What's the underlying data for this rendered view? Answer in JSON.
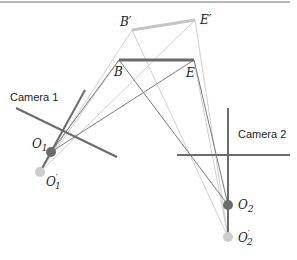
{
  "diagram": {
    "cameras": [
      {
        "label": "Camera 1",
        "center": "O_1",
        "center_shifted": "O_1'"
      },
      {
        "label": "Camera 2",
        "center": "O_2",
        "center_shifted": "O_2'"
      }
    ],
    "points": {
      "B": "B",
      "E": "E",
      "B_prime": "B′",
      "E_prime": "E′",
      "O1": "O",
      "O1_sub": "1",
      "O1p": "O",
      "O1p_sub": "1",
      "O1p_mark": "′",
      "O2": "O",
      "O2_sub": "2",
      "O2p": "O",
      "O2p_sub": "2",
      "O2p_mark": "′"
    },
    "labels": {
      "camera1": "Camera 1",
      "camera2": "Camera 2"
    },
    "colors": {
      "dark": "#6b6b6b",
      "light": "#c8c8c8",
      "mid": "#8a8a8a",
      "top_rule": "#9a9a9a"
    }
  }
}
